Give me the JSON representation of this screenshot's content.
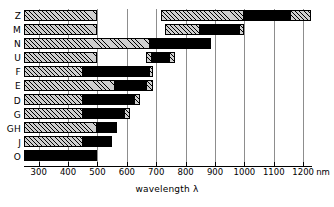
{
  "chart_data": {
    "type": "bar",
    "title": "",
    "subtitle": "",
    "xlabel": "wavelength λ",
    "ylabel": "",
    "unit": "nm",
    "orientation": "horizontal",
    "grid": true,
    "legend": null,
    "xlim": [
      250,
      1230
    ],
    "xticks": [
      300,
      400,
      500,
      600,
      700,
      800,
      900,
      1000,
      1100,
      1200
    ],
    "xticklabels": [
      "300",
      "400",
      "500",
      "600",
      "700",
      "800",
      "900",
      "1000",
      "1100",
      "1200"
    ],
    "categories": [
      "Z",
      "M",
      "N",
      "U",
      "F",
      "E",
      "D",
      "G",
      "GH",
      "J",
      "O"
    ],
    "note": "Each category is drawn as one or more ranges along the wavelength axis; each range is split into hatched (light) and solid (black) sub-segments.",
    "series": [
      {
        "name": "Z",
        "ranges": [
          {
            "start": 250,
            "end": 500,
            "fill": "hatch"
          },
          {
            "start": 715,
            "end": 1000,
            "fill": "hatch"
          },
          {
            "start": 1000,
            "end": 1155,
            "fill": "solid"
          },
          {
            "start": 1155,
            "end": 1225,
            "fill": "hatch"
          }
        ]
      },
      {
        "name": "M",
        "ranges": [
          {
            "start": 250,
            "end": 500,
            "fill": "hatch"
          },
          {
            "start": 730,
            "end": 850,
            "fill": "hatch"
          },
          {
            "start": 850,
            "end": 980,
            "fill": "solid"
          },
          {
            "start": 980,
            "end": 1000,
            "fill": "hatch"
          }
        ]
      },
      {
        "name": "N",
        "ranges": [
          {
            "start": 250,
            "end": 680,
            "fill": "hatch"
          },
          {
            "start": 680,
            "end": 885,
            "fill": "solid"
          }
        ]
      },
      {
        "name": "U",
        "ranges": [
          {
            "start": 250,
            "end": 500,
            "fill": "hatch"
          },
          {
            "start": 665,
            "end": 685,
            "fill": "hatch"
          },
          {
            "start": 685,
            "end": 745,
            "fill": "solid"
          },
          {
            "start": 745,
            "end": 765,
            "fill": "hatch"
          }
        ]
      },
      {
        "name": "F",
        "ranges": [
          {
            "start": 250,
            "end": 450,
            "fill": "hatch"
          },
          {
            "start": 450,
            "end": 675,
            "fill": "solid"
          },
          {
            "start": 675,
            "end": 690,
            "fill": "hatch"
          }
        ]
      },
      {
        "name": "E",
        "ranges": [
          {
            "start": 250,
            "end": 560,
            "fill": "hatch"
          },
          {
            "start": 560,
            "end": 665,
            "fill": "solid"
          },
          {
            "start": 665,
            "end": 690,
            "fill": "hatch"
          }
        ]
      },
      {
        "name": "D",
        "ranges": [
          {
            "start": 250,
            "end": 450,
            "fill": "hatch"
          },
          {
            "start": 450,
            "end": 625,
            "fill": "solid"
          },
          {
            "start": 625,
            "end": 645,
            "fill": "hatch"
          }
        ]
      },
      {
        "name": "G",
        "ranges": [
          {
            "start": 250,
            "end": 450,
            "fill": "hatch"
          },
          {
            "start": 450,
            "end": 590,
            "fill": "solid"
          },
          {
            "start": 590,
            "end": 610,
            "fill": "hatch"
          }
        ]
      },
      {
        "name": "GH",
        "ranges": [
          {
            "start": 250,
            "end": 500,
            "fill": "hatch"
          },
          {
            "start": 500,
            "end": 565,
            "fill": "solid"
          }
        ]
      },
      {
        "name": "J",
        "ranges": [
          {
            "start": 250,
            "end": 450,
            "fill": "hatch"
          },
          {
            "start": 450,
            "end": 550,
            "fill": "solid"
          }
        ]
      },
      {
        "name": "O",
        "ranges": [
          {
            "start": 250,
            "end": 500,
            "fill": "solid"
          }
        ]
      }
    ],
    "colors": {
      "hatch_fill": "#cfcfcf",
      "hatch_line": "#000000",
      "solid_fill": "#000000",
      "grid": "#8d8d8d",
      "axis": "#000000",
      "background": "#ffffff"
    }
  }
}
